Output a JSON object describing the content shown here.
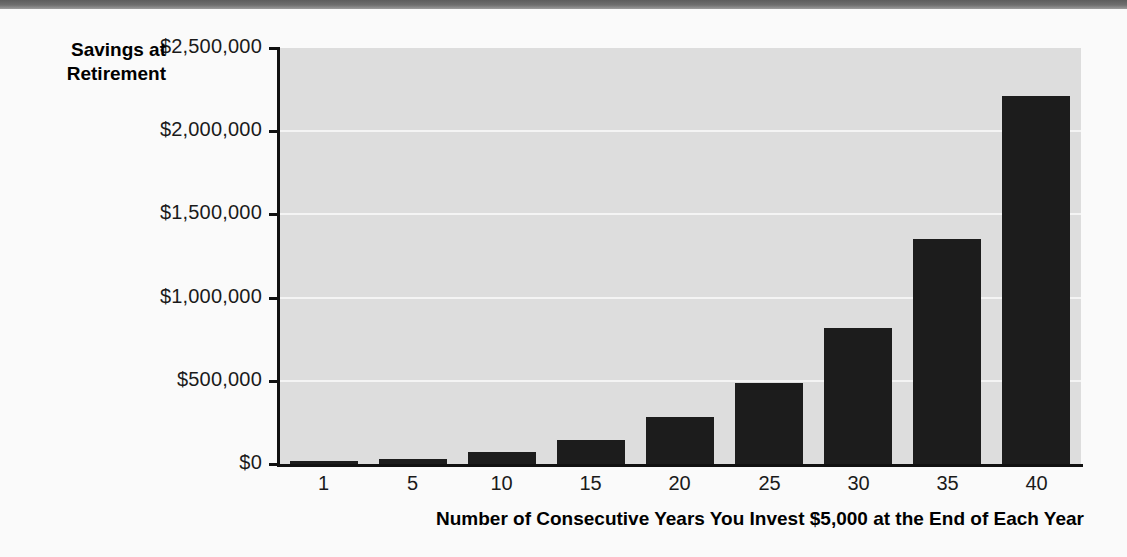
{
  "page": {
    "background_color": "#fafafa",
    "top_band_color": "#6f6f6f"
  },
  "chart_data": {
    "type": "bar",
    "title": "",
    "subtitle": "",
    "xlabel": "Number of Consecutive Years You Invest $5,000 at the End of Each Year",
    "ylabel": "Savings at Retirement",
    "ylabel_line1": "Savings at",
    "ylabel_line2": "Retirement",
    "categories": [
      "1",
      "5",
      "10",
      "15",
      "20",
      "25",
      "30",
      "35",
      "40"
    ],
    "values": [
      5000,
      30000,
      72000,
      144000,
      282000,
      487000,
      817000,
      1352000,
      2212000
    ],
    "ylim": [
      0,
      2500000
    ],
    "ytick_values": [
      0,
      500000,
      1000000,
      1500000,
      2000000,
      2500000
    ],
    "ytick_labels": [
      "$0",
      "$500,000",
      "$1,000,000",
      "$1,500,000",
      "$2,000,000",
      "$2,500,000"
    ],
    "xtick_labels": [
      "1",
      "5",
      "10",
      "15",
      "20",
      "25",
      "30",
      "35",
      "40"
    ],
    "grid": true,
    "grid_color": "#f4f4f4",
    "plot_background": "#dddddd",
    "bar_color": "#1c1c1c",
    "axis_color": "#111111",
    "legend": null,
    "legend_position": "none",
    "annotations": []
  }
}
